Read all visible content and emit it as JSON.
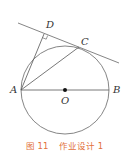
{
  "figure": {
    "points": {
      "A": "A",
      "B": "B",
      "C": "C",
      "D": "D",
      "O": "O"
    },
    "caption": "图 11    作业设计 1",
    "colors": {
      "line": "#555555",
      "caption": "#e2703a",
      "center_dot": "#111111"
    }
  }
}
